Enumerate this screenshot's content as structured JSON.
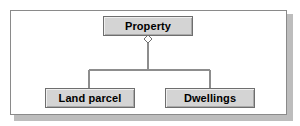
{
  "diagram": {
    "type": "uml-aggregation",
    "frame": {
      "name": "diagram-frame",
      "border_color": "#8a8a8a",
      "background": "#ffffff",
      "shadow_color": "#bdbdbd"
    },
    "node_style": {
      "fill": "#d4d4d4",
      "border": "#6e6e6e",
      "text_color": "#000000"
    },
    "line_color": "#8d8d8d",
    "nodes": [
      {
        "id": "property",
        "label": "Property",
        "role": "whole"
      },
      {
        "id": "land-parcel",
        "label": "Land parcel",
        "role": "part"
      },
      {
        "id": "dwellings",
        "label": "Dwellings",
        "role": "part"
      }
    ],
    "relationships": [
      {
        "from": "property",
        "to": "land-parcel",
        "kind": "aggregation",
        "marker": "hollow-diamond"
      },
      {
        "from": "property",
        "to": "dwellings",
        "kind": "aggregation",
        "marker": "hollow-diamond"
      }
    ],
    "marker": {
      "name": "aggregation-diamond",
      "fill": "#ffffff",
      "stroke": "#6e6e6e"
    }
  }
}
